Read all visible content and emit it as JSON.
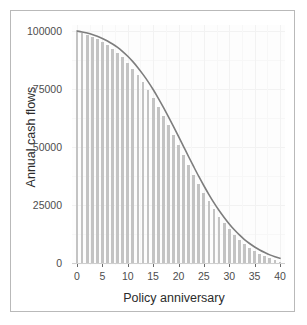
{
  "chart_data": {
    "type": "bar",
    "title": "",
    "subtitle": "",
    "xlabel": "Policy anniversary",
    "ylabel": "Annual cash flows",
    "xlim": [
      0,
      40
    ],
    "ylim": [
      0,
      100000
    ],
    "grid": true,
    "legend": null,
    "legend_position": "none",
    "x_ticks": [
      0,
      5,
      10,
      15,
      20,
      25,
      30,
      35,
      40
    ],
    "x_tick_labels": [
      "0",
      "5",
      "10",
      "15",
      "20",
      "25",
      "30",
      "35",
      "40"
    ],
    "y_ticks": [
      0,
      25000,
      50000,
      75000,
      100000
    ],
    "y_tick_labels": [
      "0",
      "25000",
      "50000",
      "75000",
      "100000"
    ],
    "categories": [
      0,
      1,
      2,
      3,
      4,
      5,
      6,
      7,
      8,
      9,
      10,
      11,
      12,
      13,
      14,
      15,
      16,
      17,
      18,
      19,
      20,
      21,
      22,
      23,
      24,
      25,
      26,
      27,
      28,
      29,
      30,
      31,
      32,
      33,
      34,
      35,
      36,
      37,
      38,
      39,
      40
    ],
    "values": [
      99500,
      99000,
      98300,
      97500,
      96500,
      95300,
      94000,
      92400,
      90600,
      88600,
      86300,
      83800,
      81000,
      78000,
      74700,
      71200,
      67400,
      63500,
      59400,
      55200,
      50900,
      46600,
      42300,
      38100,
      34100,
      30200,
      26600,
      23200,
      20000,
      17200,
      14500,
      12200,
      10100,
      8200,
      6600,
      5200,
      4000,
      3000,
      2100,
      1300,
      600
    ],
    "series": [
      {
        "name": "Annual cash flows",
        "type": "bar",
        "color": "#c3c3c3",
        "values": [
          99500,
          99000,
          98300,
          97500,
          96500,
          95300,
          94000,
          92400,
          90600,
          88600,
          86300,
          83800,
          81000,
          78000,
          74700,
          71200,
          67400,
          63500,
          59400,
          55200,
          50900,
          46600,
          42300,
          38100,
          34100,
          30200,
          26600,
          23200,
          20000,
          17200,
          14500,
          12200,
          10100,
          8200,
          6600,
          5200,
          4000,
          3000,
          2100,
          1300,
          600
        ]
      },
      {
        "name": "Fitted curve",
        "type": "line",
        "color": "#7d7d7d",
        "values": [
          100000,
          99600,
          99100,
          98500,
          97700,
          96800,
          95700,
          94400,
          92900,
          91100,
          89100,
          86800,
          84200,
          81300,
          78200,
          74800,
          71100,
          67200,
          63100,
          58900,
          54600,
          50200,
          45800,
          41500,
          37300,
          33300,
          29500,
          25900,
          22600,
          19600,
          16800,
          14300,
          12100,
          10100,
          8400,
          6900,
          5600,
          4500,
          3500,
          2700,
          2000
        ]
      }
    ],
    "annotations": []
  },
  "style": {
    "panel_background": "#fdfdfd",
    "figure_background": "#ffffff",
    "frame_border_color": "#b9b9b9",
    "gridline_major_color": "#f2f2f2",
    "gridline_minor_color": "#f7f7f7",
    "bar_color": "#c3c3c3",
    "line_color": "#7d7d7d",
    "axis_text_color": "#4d4d4d",
    "axis_title_color": "#2b2b2b",
    "tick_mark_color": "#6b6b6b"
  }
}
